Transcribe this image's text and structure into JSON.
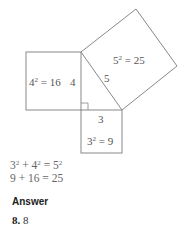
{
  "diagram": {
    "left_square_label_base": "4",
    "left_square_label_exp": "2",
    "left_square_label_rest": " = 16",
    "left_side_label": "4",
    "hyp_square_label_base": "5",
    "hyp_square_label_exp": "2",
    "hyp_square_label_rest": " = 25",
    "hyp_side_label": "5",
    "bottom_side_label": "3",
    "bottom_square_label_base": "3",
    "bottom_square_label_exp": "2",
    "bottom_square_label_rest": " = 9",
    "line_color": "#888888"
  },
  "equations": [
    {
      "parts": [
        "3",
        "2",
        " + 4",
        "2",
        " = 5",
        "2"
      ]
    },
    {
      "text": "9 + 16 = 25"
    }
  ],
  "answer": {
    "heading": "Answer",
    "number": "8.",
    "value": "8"
  }
}
